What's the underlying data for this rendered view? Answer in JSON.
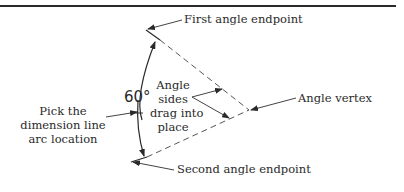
{
  "diagram": {
    "labels": {
      "first_endpoint": "First angle endpoint",
      "second_endpoint": "Second angle endpoint",
      "vertex": "Angle vertex",
      "sides_line1": "Angle",
      "sides_line2": "sides",
      "sides_line3": "drag into",
      "sides_line4": "place",
      "pick_line1": "Pick the",
      "pick_line2": "dimension line",
      "pick_line3": "arc location"
    },
    "angle_value": "60°",
    "colors": {
      "line": "#2a2a2a",
      "dashed": "#555555"
    }
  }
}
